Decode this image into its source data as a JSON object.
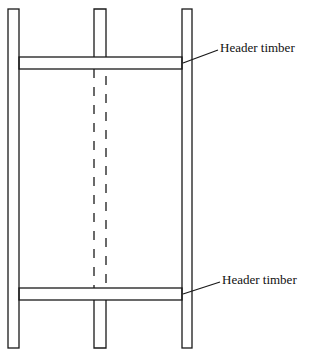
{
  "diagram": {
    "labels": {
      "top_header": "Header timber",
      "bottom_header": "Header timber"
    },
    "colors": {
      "stroke": "#1a1a1a",
      "background": "#ffffff"
    }
  }
}
